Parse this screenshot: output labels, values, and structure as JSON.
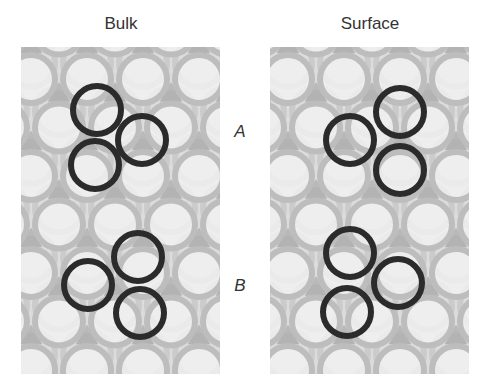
{
  "panels": [
    {
      "id": "bulk",
      "title": "Bulk"
    },
    {
      "id": "surface",
      "title": "Surface"
    }
  ],
  "site_labels": {
    "a": "A",
    "b": "B"
  },
  "colors": {
    "background_layer": "#dcdcdc",
    "ring_stroke": "#bdbdbd",
    "ring_fill": "#f4f4f4",
    "hollow_fill": "#a9a9a9",
    "highlight_ring": "#2b2b2b",
    "text": "#333333"
  }
}
